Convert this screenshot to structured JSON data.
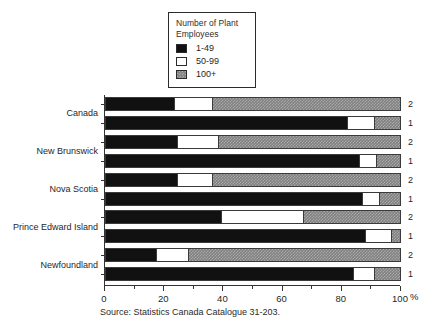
{
  "title_fragment": "",
  "legend": {
    "title_line1": "Number of Plant",
    "title_line2": "Employees",
    "items": [
      {
        "label": "1-49",
        "swatch": "black",
        "color": "#111111"
      },
      {
        "label": "50-99",
        "swatch": "white",
        "color": "#ffffff"
      },
      {
        "label": "100+",
        "swatch": "gray",
        "color": "#808080"
      }
    ]
  },
  "axis": {
    "x_label": "%",
    "x_ticks": [
      "0",
      "20",
      "40",
      "60",
      "80",
      "100"
    ],
    "x_min": 0,
    "x_max": 100
  },
  "source": "Source: Statistics Canada Catalogue 31-203.",
  "groups": [
    {
      "label": "Canada"
    },
    {
      "label": "New Brunswick"
    },
    {
      "label": "Nova Scotia"
    },
    {
      "label": "Prince Edward Island"
    },
    {
      "label": "Newfoundland"
    }
  ],
  "bar_numbers": [
    "2",
    "1"
  ],
  "chart_data": {
    "type": "bar",
    "orientation": "horizontal",
    "stacked": true,
    "stacked_total": 100,
    "title": "",
    "xlabel": "%",
    "ylabel": "",
    "xlim": [
      0,
      100
    ],
    "grid": false,
    "legend_position": "top-center",
    "legend_title": "Number of Plant Employees",
    "categories": [
      "Canada 2",
      "Canada 1",
      "New Brunswick 2",
      "New Brunswick 1",
      "Nova Scotia 2",
      "Nova Scotia 1",
      "Prince Edward Island 2",
      "Prince Edward Island 1",
      "Newfoundland 2",
      "Newfoundland 1"
    ],
    "series": [
      {
        "name": "1-49",
        "values": [
          23,
          82,
          24,
          86,
          24,
          87,
          39,
          88,
          17,
          84
        ]
      },
      {
        "name": "50-99",
        "values": [
          13,
          9,
          14,
          6,
          12,
          6,
          28,
          9,
          11,
          7
        ]
      },
      {
        "name": "100+",
        "values": [
          64,
          9,
          62,
          8,
          64,
          7,
          33,
          3,
          72,
          9
        ]
      }
    ],
    "rows": [
      {
        "group": "Canada",
        "bar": "2",
        "segments": [
          23,
          13,
          64
        ]
      },
      {
        "group": "Canada",
        "bar": "1",
        "segments": [
          82,
          9,
          9
        ]
      },
      {
        "group": "New Brunswick",
        "bar": "2",
        "segments": [
          24,
          14,
          62
        ]
      },
      {
        "group": "New Brunswick",
        "bar": "1",
        "segments": [
          86,
          6,
          8
        ]
      },
      {
        "group": "Nova Scotia",
        "bar": "2",
        "segments": [
          24,
          12,
          64
        ]
      },
      {
        "group": "Nova Scotia",
        "bar": "1",
        "segments": [
          87,
          6,
          7
        ]
      },
      {
        "group": "Prince Edward Island",
        "bar": "2",
        "segments": [
          39,
          28,
          33
        ]
      },
      {
        "group": "Prince Edward Island",
        "bar": "1",
        "segments": [
          88,
          9,
          3
        ]
      },
      {
        "group": "Newfoundland",
        "bar": "2",
        "segments": [
          17,
          11,
          72
        ]
      },
      {
        "group": "Newfoundland",
        "bar": "1",
        "segments": [
          84,
          7,
          9
        ]
      }
    ]
  }
}
